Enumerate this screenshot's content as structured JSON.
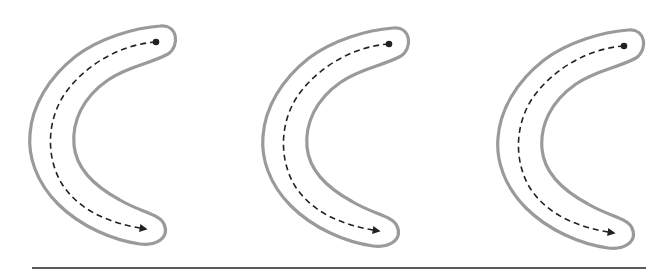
{
  "diagram": {
    "type": "path-illustration",
    "colors": {
      "background": "#ffffff",
      "channel_outline": "#9a9a9a",
      "path": "#222222",
      "baseline": "#5a5a5a"
    },
    "shapes": [
      {
        "id": "channel-1",
        "offset_x": 0,
        "offset_y": 0,
        "start": "dot",
        "end": "arrowhead"
      },
      {
        "id": "channel-2",
        "offset_x": 233,
        "offset_y": 2,
        "start": "dot",
        "end": "arrowhead"
      },
      {
        "id": "channel-3",
        "offset_x": 468,
        "offset_y": 4,
        "start": "dot",
        "end": "arrowhead"
      }
    ],
    "baseline": {
      "x1": 32,
      "x2": 646,
      "y": 268
    }
  }
}
